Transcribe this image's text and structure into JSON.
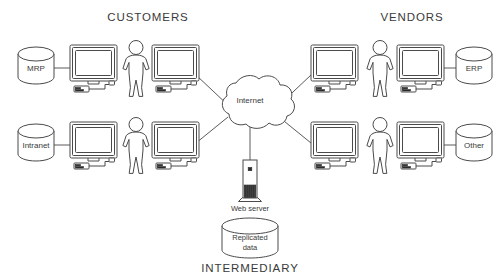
{
  "diagram": {
    "title_left": "CUSTOMERS",
    "title_right": "VENDORS",
    "title_bottom": "INTERMEDIARY",
    "cloud_label": "Internet",
    "server_label": "Web server",
    "replicated_db_label_line1": "Replicated",
    "replicated_db_label_line2": "data",
    "databases": {
      "customer_top": "MRP",
      "customer_bottom": "Intranet",
      "vendor_top": "ERP",
      "vendor_bottom": "Other"
    },
    "colors": {
      "background": "#ffffff",
      "stroke": "#4a4a4a",
      "link": "#5a5a5a",
      "text": "#3a3a3a",
      "solid": "#2b2b2b"
    }
  }
}
